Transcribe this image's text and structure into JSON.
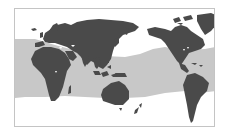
{
  "map": {
    "type": "world-distribution-map",
    "projection": "pacific-centered",
    "description": "Species range map with shaded tropical/subtropical ocean band",
    "colors": {
      "background": "#ffffff",
      "frame": "#c4c4c4",
      "land": "#4a4a4a",
      "range_band": "#c8c8c8"
    },
    "range_band": {
      "label": "distribution-range",
      "left_edge": {
        "top_y": 38,
        "bottom_y": 96
      },
      "center": {
        "top_y": 52,
        "bottom_y": 96
      },
      "right_edge": {
        "top_y": 49,
        "bottom_y": 91
      }
    },
    "regions": [
      {
        "name": "Europe"
      },
      {
        "name": "Africa"
      },
      {
        "name": "Asia"
      },
      {
        "name": "Australia"
      },
      {
        "name": "New Zealand"
      },
      {
        "name": "North America"
      },
      {
        "name": "Greenland"
      },
      {
        "name": "South America"
      }
    ]
  }
}
